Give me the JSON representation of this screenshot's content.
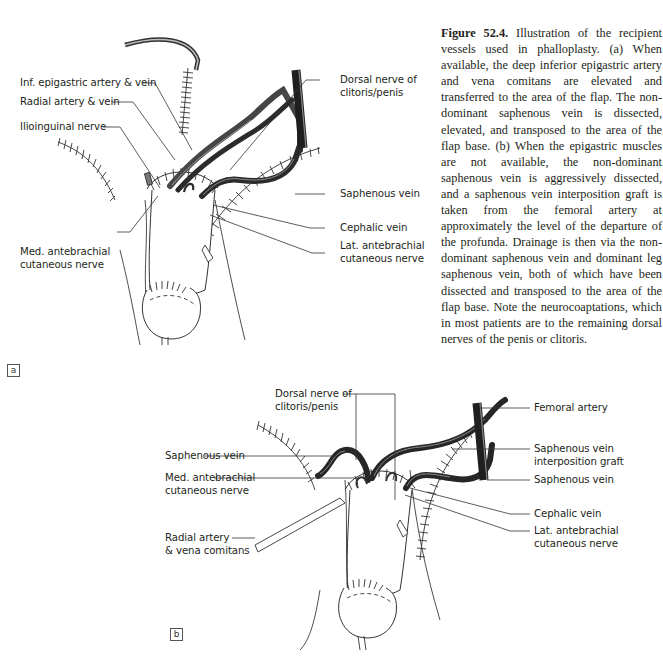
{
  "figure": {
    "number_label": "Figure 52.4.",
    "caption_text": "Illustration of the recipient vessels used in phalloplasty. (a) When available, the deep inferior epigastric artery and vena comitans are elevated and transferred to the area of the flap. The non-dominant saphenous vein is dissected, elevated, and transposed to the area of the flap base. (b) When the epigastric muscles are not available, the non-dominant saphenous vein is aggressively dissected, and a saphenous vein interposition graft is taken from the femoral artery at approximately the level of the departure of the profunda. Drainage is then via the non-dominant saphenous vein and dominant leg saphenous vein, both of which have been dissected and transposed to the area of the flap base. Note the neurocoaptations, which in most patients are to the remaining dorsal nerves of the penis or clitoris."
  },
  "panel_a": {
    "tag": "a",
    "labels": {
      "inf_epigastric": "Inf. epigastric artery & vein",
      "radial": "Radial artery & vein",
      "ilioinguinal": "Ilioinguinal nerve",
      "med_antebrachial_1": "Med. antebrachial",
      "med_antebrachial_2": "cutaneous nerve",
      "dorsal_nerve_1": "Dorsal nerve of",
      "dorsal_nerve_2": "clitoris/penis",
      "saphenous": "Saphenous vein",
      "cephalic": "Cephalic vein",
      "lat_antebrachial_1": "Lat. antebrachial",
      "lat_antebrachial_2": "cutaneous nerve"
    }
  },
  "panel_b": {
    "tag": "b",
    "labels": {
      "dorsal_nerve_1": "Dorsal nerve of",
      "dorsal_nerve_2": "clitoris/penis",
      "saphenous_left": "Saphenous vein",
      "med_antebrachial_1": "Med. antebrachial",
      "med_antebrachial_2": "cutaneous nerve",
      "radial_1": "Radial artery",
      "radial_2": "& vena comitans",
      "femoral": "Femoral artery",
      "interposition_1": "Saphenous vein",
      "interposition_2": "interposition graft",
      "saphenous_right": "Saphenous vein",
      "cephalic": "Cephalic vein",
      "lat_antebrachial_1": "Lat. antebrachial",
      "lat_antebrachial_2": "cutaneous nerve"
    }
  },
  "colors": {
    "ink": "#231f20",
    "vessel": "#2b2b2b",
    "vessel_highlight": "#8a8a8a",
    "line": "#3a3a3a"
  }
}
